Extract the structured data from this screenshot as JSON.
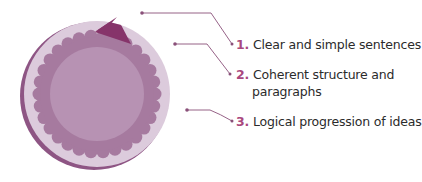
{
  "diagram": {
    "colors": {
      "outer_ring": "#dccbdc",
      "outer_shadow": "#8e5584",
      "scallop_ring": "#a67a9f",
      "inner_disc": "#b792b3",
      "wedge": "#86346a",
      "leader_line": "#8a5079",
      "number": "#a9487e",
      "text": "#2b2b2b"
    },
    "items": [
      {
        "number": "1.",
        "text": "Clear and simple sentences"
      },
      {
        "number": "2.",
        "text_line1": "Coherent structure and",
        "text_line2": "paragraphs"
      },
      {
        "number": "3.",
        "text": "Logical progression of ideas"
      }
    ]
  }
}
